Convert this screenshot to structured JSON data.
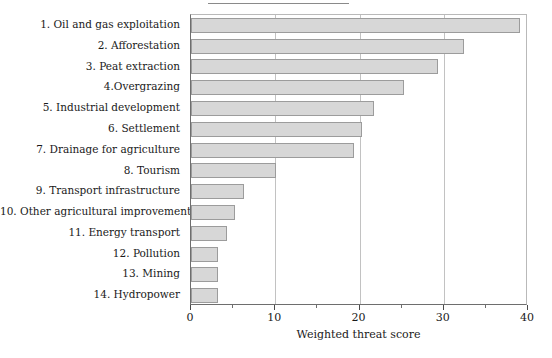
{
  "chart_data": {
    "type": "bar",
    "orientation": "horizontal",
    "title": "",
    "xlabel": "Weighted threat score",
    "ylabel": "",
    "xlim": [
      0,
      40
    ],
    "ylim": null,
    "grid": true,
    "grid_axis": "x",
    "legend": null,
    "categories": [
      "1. Oil and gas exploitation",
      "2. Afforestation",
      "3. Peat extraction",
      "4.Overgrazing",
      "5. Industrial development",
      "6. Settlement",
      "7. Drainage for agriculture",
      "8. Tourism",
      "9. Transport infrastructure",
      "10. Other agricultural improvement",
      "11. Energy transport",
      "12. Pollution",
      "13. Mining",
      "14. Hydropower"
    ],
    "values": [
      39,
      32.4,
      29.3,
      25.3,
      21.7,
      20.3,
      19.4,
      10.1,
      6.3,
      5.2,
      4.3,
      3.2,
      3.2,
      3.2
    ],
    "xticks": [
      0,
      10,
      20,
      30,
      40
    ],
    "xticklabels": [
      "0",
      "10",
      "20",
      "30",
      "40"
    ],
    "xminorticks": [
      5,
      15,
      25,
      35
    ],
    "bar_fill_color": "#d7d7d7",
    "bar_edge_color": "#9c9c9c",
    "axis_color": "#6e6e6e",
    "grid_color": "#c2c2c2"
  }
}
